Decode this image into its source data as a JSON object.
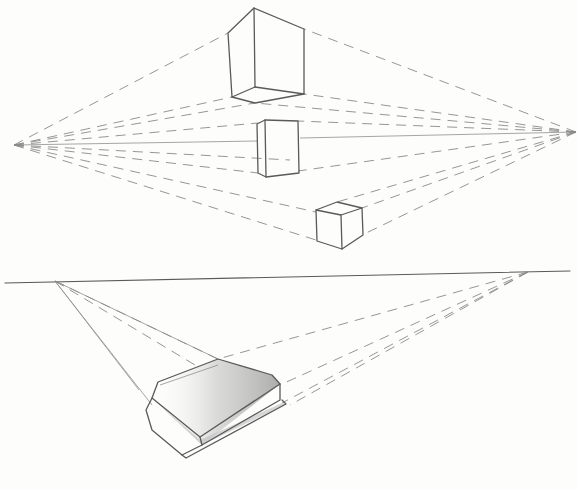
{
  "image": {
    "description": "Pencil sketch illustrating two-point perspective",
    "upper_diagram": {
      "vanishing_points": [
        {
          "x": 14,
          "y": 145
        },
        {
          "x": 576,
          "y": 132
        }
      ],
      "horizon": {
        "x1": 14,
        "y1": 145,
        "x2": 576,
        "y2": 132
      },
      "cubes": [
        "above-horizon cube",
        "on-horizon cube",
        "below-horizon cube"
      ]
    },
    "lower_diagram": {
      "horizon": {
        "x1": 5,
        "y1": 283,
        "x2": 570,
        "y2": 271
      },
      "vanishing_points": [
        {
          "x": 55,
          "y": 281
        },
        {
          "x": 528,
          "y": 272
        }
      ],
      "object": "book below horizon"
    },
    "colors": {
      "paper": "#fdfdfc",
      "graphite": "#5a5a5a",
      "construction": "#8a8a8a"
    }
  }
}
